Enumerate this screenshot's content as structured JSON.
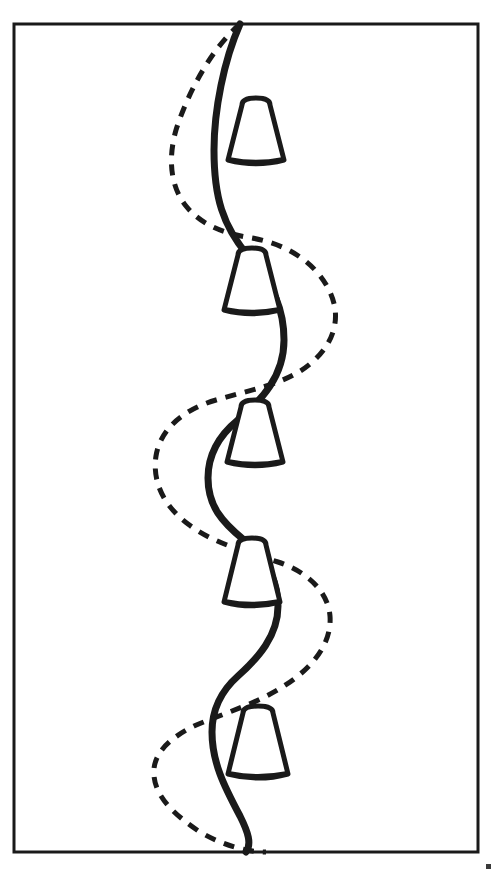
{
  "figure": {
    "title": "Line drawing of two interwoven vertical wavy curves with five bell-shaped forms",
    "background_color": "#ffffff",
    "ink_color": "#1a1a1a",
    "width": 497,
    "height": 876
  },
  "frame": {
    "label": "Rectangular border frame",
    "x": 14,
    "y": 24,
    "width": 464,
    "height": 828,
    "stroke_color": "#1a1a1a",
    "stroke_width": 3
  },
  "curves": [
    {
      "id": "solid-wave",
      "label": "Bold solid sinuous curve",
      "style": "solid",
      "stroke_color": "#1a1a1a",
      "stroke_width": 7,
      "path": "M 240 24 C 224 60 214 110 214 150 C 214 196 222 226 250 258 C 274 286 284 310 284 340 C 284 376 262 400 238 420 C 216 438 208 458 208 478 C 208 506 222 522 244 540 C 268 560 278 582 278 606 C 278 636 258 658 238 676 C 220 692 212 710 212 732 C 212 762 224 786 240 816 C 248 832 252 844 246 852"
    },
    {
      "id": "dashed-wave",
      "label": "Dashed sinuous curve",
      "style": "dashed",
      "stroke_color": "#1a1a1a",
      "stroke_width": 5,
      "dash_pattern": "11 9",
      "path": "M 240 24 C 212 48 188 92 176 130 C 168 158 170 186 186 206 C 202 226 226 234 252 238 C 286 244 316 262 330 292 C 342 318 334 344 310 364 C 286 384 250 390 216 400 C 182 410 160 430 156 456 C 152 482 164 506 188 524 C 214 544 248 552 278 562 C 308 572 328 592 330 616 C 332 644 312 668 284 686 C 256 704 222 714 194 726 C 166 740 152 756 154 776 C 156 798 176 816 200 832 C 224 846 248 852 266 852"
    }
  ],
  "cones": [
    {
      "id": "cone-1",
      "label": "Bell-shaped form 1 (top)",
      "center_x": 256,
      "top_y": 98,
      "bottom_y": 160,
      "top_half_width": 14,
      "bottom_half_width": 28
    },
    {
      "id": "cone-2",
      "label": "Bell-shaped form 2",
      "center_x": 252,
      "top_y": 248,
      "bottom_y": 310,
      "top_half_width": 14,
      "bottom_half_width": 28
    },
    {
      "id": "cone-3",
      "label": "Bell-shaped form 3 (middle)",
      "center_x": 255,
      "top_y": 400,
      "bottom_y": 462,
      "top_half_width": 14,
      "bottom_half_width": 28
    },
    {
      "id": "cone-4",
      "label": "Bell-shaped form 4",
      "center_x": 252,
      "top_y": 538,
      "bottom_y": 602,
      "top_half_width": 14,
      "bottom_half_width": 28
    },
    {
      "id": "cone-5",
      "label": "Bell-shaped form 5 (bottom)",
      "center_x": 258,
      "top_y": 706,
      "bottom_y": 774,
      "top_half_width": 15,
      "bottom_half_width": 30
    }
  ],
  "corner_mark": {
    "label": "Small ink mark outside lower right corner",
    "x": 486,
    "y": 864,
    "size": 5,
    "color": "#3a3a3a"
  }
}
